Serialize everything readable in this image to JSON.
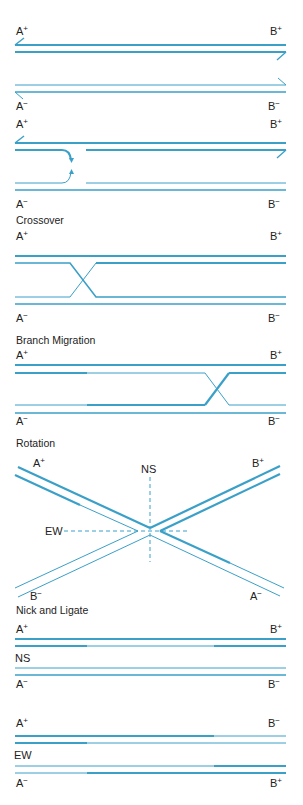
{
  "colors": {
    "strand": "#3aa0c8",
    "text": "#222222",
    "background": "#ffffff"
  },
  "panels": [
    {
      "id": "initial",
      "title": "",
      "labels": {
        "top_left": "A",
        "top_left_sup": "+",
        "top_right": "B",
        "top_right_sup": "+",
        "bottom_left": "A",
        "bottom_left_sup": "−",
        "bottom_right": "B",
        "bottom_right_sup": "−"
      }
    },
    {
      "id": "strand-invasion",
      "title": "",
      "labels": {
        "top_left": "A",
        "top_left_sup": "+",
        "top_right": "B",
        "top_right_sup": "+",
        "bottom_left": "A",
        "bottom_left_sup": "−",
        "bottom_right": "B",
        "bottom_right_sup": "−"
      }
    },
    {
      "id": "crossover",
      "title": "Crossover",
      "labels": {
        "top_left": "A",
        "top_left_sup": "+",
        "top_right": "B",
        "top_right_sup": "+",
        "bottom_left": "A",
        "bottom_left_sup": "−",
        "bottom_right": "B",
        "bottom_right_sup": "−"
      }
    },
    {
      "id": "branch-migration",
      "title": "Branch Migration",
      "labels": {
        "top_left": "A",
        "top_left_sup": "+",
        "top_right": "B",
        "top_right_sup": "+",
        "bottom_left": "A",
        "bottom_left_sup": "−",
        "bottom_right": "B",
        "bottom_right_sup": "−"
      }
    },
    {
      "id": "rotation",
      "title": "Rotation",
      "labels": {
        "top_left": "A",
        "top_left_sup": "+",
        "top_right": "B",
        "top_right_sup": "+",
        "bottom_left": "B",
        "bottom_left_sup": "−",
        "bottom_right": "A",
        "bottom_right_sup": "−",
        "vertical_axis": "NS",
        "horizontal_axis": "EW"
      }
    },
    {
      "id": "nick-ligate-ns",
      "title": "Nick and Ligate",
      "middle_label": "NS",
      "labels": {
        "top_left": "A",
        "top_left_sup": "+",
        "top_right": "B",
        "top_right_sup": "+",
        "bottom_left": "A",
        "bottom_left_sup": "−",
        "bottom_right": "B",
        "bottom_right_sup": "−"
      }
    },
    {
      "id": "nick-ligate-ew",
      "title": "",
      "middle_label": "EW",
      "labels": {
        "top_left": "A",
        "top_left_sup": "+",
        "top_right": "B",
        "top_right_sup": "−",
        "bottom_left": "A",
        "bottom_left_sup": "−",
        "bottom_right": "B",
        "bottom_right_sup": "+"
      }
    }
  ]
}
